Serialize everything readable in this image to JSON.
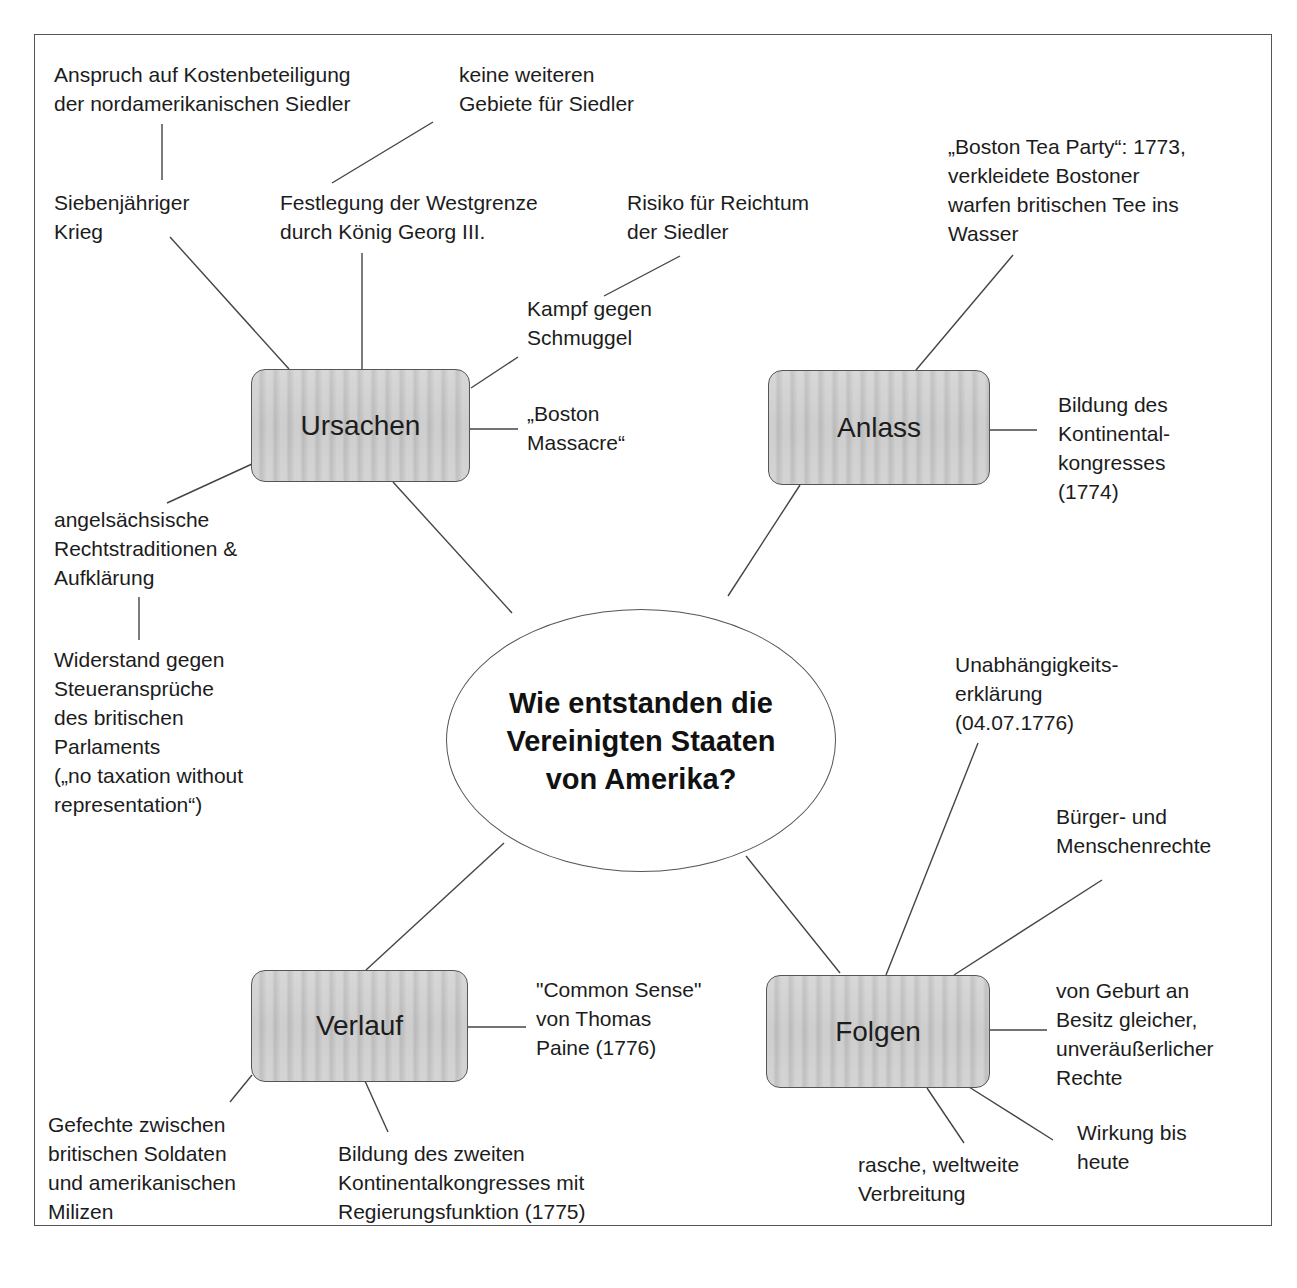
{
  "title": {
    "lines": [
      "Wie entstanden die",
      "Vereinigten Staaten",
      "von Amerika?"
    ]
  },
  "hubs": {
    "ursachen": "Ursachen",
    "anlass": "Anlass",
    "verlauf": "Verlauf",
    "folgen": "Folgen"
  },
  "ursachen": {
    "kostenbeteiligung": [
      "Anspruch auf Kostenbeteiligung",
      "der nordamerikanischen Siedler"
    ],
    "keine_gebiete": [
      "keine weiteren",
      "Gebiete für Siedler"
    ],
    "siebenjaehriger_krieg": [
      "Siebenjähriger",
      "Krieg"
    ],
    "westgrenze": [
      "Festlegung der Westgrenze",
      "durch König Georg III."
    ],
    "risiko": [
      "Risiko für Reichtum",
      "der Siedler"
    ],
    "schmuggel": [
      "Kampf gegen",
      "Schmuggel"
    ],
    "boston_massacre": [
      "„Boston",
      "Massacre“"
    ],
    "rechtstraditionen": [
      "angelsächsische",
      "Rechtstraditionen &",
      "Aufklärung"
    ],
    "widerstand": [
      "Widerstand gegen",
      "Steueransprüche",
      "des britischen",
      "Parlaments",
      "(„no taxation without",
      "representation“)"
    ]
  },
  "anlass": {
    "tea_party": [
      "„Boston Tea Party“: 1773,",
      "verkleidete Bostoner",
      "warfen britischen Tee ins",
      "Wasser"
    ],
    "kontinentalkongress": [
      "Bildung des",
      "Kontinental-",
      "kongresses",
      "(1774)"
    ]
  },
  "verlauf": {
    "common_sense": [
      "\"Common Sense\"",
      "von Thomas",
      "Paine (1776)"
    ],
    "gefechte": [
      "Gefechte zwischen",
      "britischen Soldaten",
      "und amerikanischen",
      "Milizen"
    ],
    "zweiter_kongress": [
      "Bildung des zweiten",
      "Kontinentalkongresses mit",
      "Regierungsfunktion (1775)"
    ]
  },
  "folgen": {
    "unabhaengigkeit": [
      "Unabhängigkeits-",
      "erklärung",
      "(04.07.1776)"
    ],
    "buergerrechte": [
      "Bürger- und",
      "Menschenrechte"
    ],
    "geburt": [
      "von Geburt an",
      "Besitz gleicher,",
      "unveräußerlicher",
      "Rechte"
    ],
    "wirkung": [
      "Wirkung bis",
      "heute"
    ],
    "verbreitung": [
      "rasche, weltweite",
      "Verbreitung"
    ]
  },
  "colors": {
    "hub_fill": "#c8c8c8",
    "line": "#444444",
    "text": "#1c1c1c"
  }
}
